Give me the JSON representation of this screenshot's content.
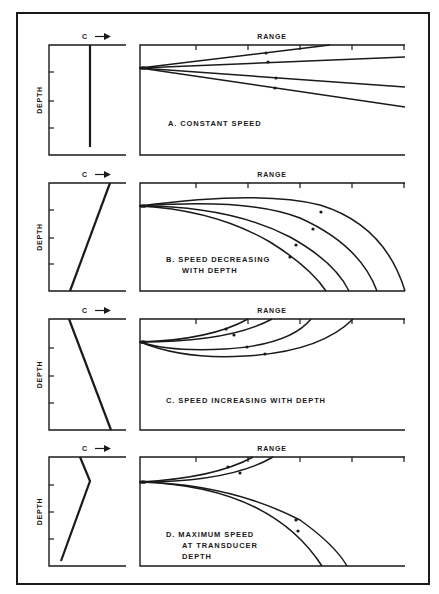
{
  "figure": {
    "frame": {
      "x": 17,
      "y": 13,
      "w": 412,
      "h": 571
    },
    "ink_color": "#1a1a1a",
    "background": "#ffffff"
  },
  "labels": {
    "speed_axis": "C",
    "range_axis": "RANGE",
    "depth_axis": "DEPTH"
  },
  "panels": [
    {
      "id": "A",
      "caption_lines": [
        "A.  CONSTANT SPEED"
      ],
      "caption_pos": {
        "x": 168,
        "y": 126
      },
      "top": 45,
      "bottom": 155,
      "profile_ticks": [
        72,
        101,
        128
      ],
      "profile_line": [
        [
          90,
          45
        ],
        [
          90,
          147
        ]
      ],
      "origin_y": 68,
      "rays": [
        {
          "d": "M140,68 L330,45",
          "arrow": [
            266,
            53
          ]
        },
        {
          "d": "M140,68 L405,57",
          "arrow": [
            268,
            62
          ]
        },
        {
          "d": "M140,68 L405,87",
          "arrow": [
            276,
            78
          ]
        },
        {
          "d": "M140,68 L405,107",
          "arrow": [
            275,
            88
          ]
        }
      ]
    },
    {
      "id": "B",
      "caption_lines": [
        "B.  SPEED DECREASING",
        "WITH DEPTH"
      ],
      "caption_pos": {
        "x": 166,
        "y": 262
      },
      "top": 183,
      "bottom": 291,
      "profile_ticks": [
        210,
        238,
        264
      ],
      "profile_line": [
        [
          110,
          183
        ],
        [
          70,
          291
        ]
      ],
      "origin_y": 206,
      "rays": [
        {
          "d": "M140,206 Q260,190 320,205 Q385,225 405,291",
          "arrow": [
            321,
            212
          ]
        },
        {
          "d": "M140,206 Q250,198 300,218 Q360,245 377,291",
          "arrow": [
            313,
            229
          ]
        },
        {
          "d": "M140,206 Q230,206 290,237 Q335,262 349,291",
          "arrow": [
            296,
            245
          ]
        },
        {
          "d": "M140,206 Q215,210 270,242 Q310,267 326,291",
          "arrow": [
            290,
            257
          ]
        }
      ]
    },
    {
      "id": "C",
      "caption_lines": [
        "C.  SPEED INCREASING WITH DEPTH"
      ],
      "caption_pos": {
        "x": 166,
        "y": 403
      },
      "top": 319,
      "bottom": 430,
      "profile_ticks": [
        348,
        376,
        403
      ],
      "profile_line": [
        [
          69,
          319
        ],
        [
          111,
          430
        ]
      ],
      "origin_y": 342,
      "rays": [
        {
          "d": "M140,342 Q210,340 248,319",
          "arrow": [
            226,
            329
          ]
        },
        {
          "d": "M140,342 Q230,342 272,319",
          "arrow": [
            234,
            335
          ]
        },
        {
          "d": "M140,342 Q170,352 225,349 Q290,345 311,319",
          "arrow": [
            247,
            347
          ]
        },
        {
          "d": "M140,342 Q185,360 245,356 Q320,352 353,319",
          "arrow": [
            265,
            354
          ]
        }
      ]
    },
    {
      "id": "D",
      "caption_lines": [
        "D.  MAXIMUM SPEED",
        "AT TRANSDUCER",
        "DEPTH"
      ],
      "caption_pos": {
        "x": 166,
        "y": 537
      },
      "top": 457,
      "bottom": 566,
      "profile_ticks": [
        485,
        512,
        539
      ],
      "profile_line": [
        [
          80,
          457
        ],
        [
          90,
          481
        ],
        [
          61,
          561
        ]
      ],
      "origin_y": 482,
      "rays": [
        {
          "d": "M140,482 Q215,478 253,457",
          "arrow": [
            228,
            467
          ]
        },
        {
          "d": "M140,482 Q230,482 273,457",
          "arrow": [
            240,
            473
          ]
        },
        {
          "d": "M140,482 Q270,486 322,566",
          "arrow": [
            296,
            520
          ]
        },
        {
          "d": "M140,482 Q230,484 300,520 Q335,545 347,566",
          "arrow": [
            298,
            531
          ]
        }
      ]
    }
  ],
  "geometry": {
    "profile_left": 49,
    "profile_right": 126,
    "range_left": 140,
    "range_right": 405,
    "range_ticks": [
      196,
      248,
      300,
      352,
      404
    ]
  }
}
